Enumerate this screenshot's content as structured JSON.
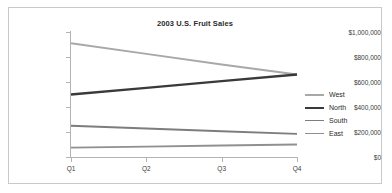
{
  "chart_data": {
    "type": "line",
    "title": "2003 U.S. Fruit Sales",
    "xlabel": "",
    "ylabel": "",
    "categories": [
      "Q1",
      "Q2",
      "Q3",
      "Q4"
    ],
    "ylim": [
      0,
      1000000
    ],
    "ytick_labels": [
      "$1,000,000",
      "$800,000",
      "$600,000",
      "$400,000",
      "$200,000",
      "$0"
    ],
    "ytick_values": [
      1000000,
      800000,
      600000,
      400000,
      200000,
      0
    ],
    "grid": false,
    "legend_position": "right",
    "series": [
      {
        "name": "West",
        "color": "#a8a8a8",
        "width": 2.0,
        "values": [
          910000,
          825000,
          740000,
          660000
        ]
      },
      {
        "name": "North",
        "color": "#3a3a3a",
        "width": 2.4,
        "values": [
          500000,
          553000,
          607000,
          660000
        ]
      },
      {
        "name": "South",
        "color": "#7d7d7d",
        "width": 1.8,
        "values": [
          250000,
          228000,
          206000,
          185000
        ]
      },
      {
        "name": "East",
        "color": "#909090",
        "width": 1.8,
        "values": [
          75000,
          83000,
          92000,
          100000
        ]
      }
    ]
  },
  "colors": {
    "frame_border": "#c9c9c9",
    "axis": "#b3b3b3",
    "text": "#2b2b2b",
    "tick_text": "#3a3a3a",
    "background": "#ffffff"
  }
}
